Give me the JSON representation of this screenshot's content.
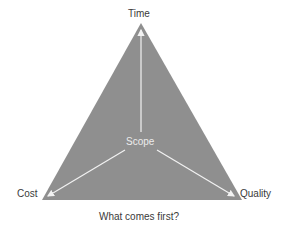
{
  "diagram": {
    "type": "project-management-triangle",
    "vertices": {
      "top": "Time",
      "bottom_left": "Cost",
      "bottom_right": "Quality"
    },
    "center": "Scope",
    "caption": "What comes first?",
    "colors": {
      "triangle_fill": "#8f8f8f",
      "arrow": "#f2f2f2",
      "text": "#3a3a3a",
      "center_text": "#ececec"
    }
  }
}
